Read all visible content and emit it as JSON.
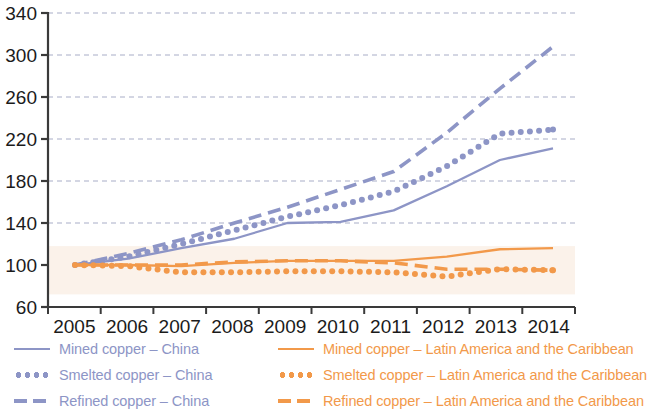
{
  "chart_data": {
    "type": "line",
    "title": "",
    "subtitle": "",
    "xlabel": "",
    "ylabel": "",
    "index_base": "2005 = 100",
    "x": [
      2005,
      2006,
      2007,
      2008,
      2009,
      2010,
      2011,
      2012,
      2013,
      2014
    ],
    "categories": [
      "2005",
      "2006",
      "2007",
      "2008",
      "2009",
      "2010",
      "2011",
      "2012",
      "2013",
      "2014"
    ],
    "ylim": [
      60,
      340
    ],
    "yticks": [
      60,
      100,
      140,
      180,
      220,
      260,
      300,
      340
    ],
    "ytick_labels": [
      "60",
      "100",
      "140",
      "180",
      "220",
      "260",
      "300",
      "340"
    ],
    "grid": true,
    "grid_style": "dashed-horizontal",
    "legend_position": "below",
    "series": [
      {
        "name": "Mined copper – China",
        "region": "China",
        "style": "solid",
        "color": "#8d95c6",
        "values": [
          100,
          106,
          116,
          125,
          140,
          141,
          152,
          175,
          200,
          211
        ]
      },
      {
        "name": "Smelted copper – China",
        "region": "China",
        "style": "dotted",
        "color": "#8d95c6",
        "values": [
          100,
          108,
          120,
          133,
          146,
          157,
          170,
          194,
          225,
          229
        ]
      },
      {
        "name": "Refined copper – China",
        "region": "China",
        "style": "dashed",
        "color": "#8d95c6",
        "values": [
          100,
          111,
          124,
          140,
          155,
          172,
          189,
          226,
          268,
          308
        ]
      },
      {
        "name": "Mined copper – Latin America and the Caribbean",
        "region": "Latin America and the Caribbean",
        "style": "solid",
        "color": "#f2994a",
        "values": [
          100,
          100,
          99,
          102,
          104,
          104,
          104,
          108,
          115,
          116
        ]
      },
      {
        "name": "Smelted copper – Latin America and the Caribbean",
        "region": "Latin America and the Caribbean",
        "style": "dotted",
        "color": "#f2994a",
        "values": [
          100,
          99,
          93,
          93,
          94,
          94,
          93,
          89,
          96,
          95
        ]
      },
      {
        "name": "Refined copper – Latin America and the Caribbean",
        "region": "Latin America and the Caribbean",
        "style": "dashed",
        "color": "#f2994a",
        "values": [
          100,
          100,
          100,
          103,
          104,
          104,
          102,
          96,
          96,
          95
        ]
      }
    ]
  },
  "legend": {
    "items": [
      {
        "label": "Mined copper – China",
        "style": "solid",
        "color": "#8d95c6"
      },
      {
        "label": "Smelted copper – China",
        "style": "dotted",
        "color": "#8d95c6"
      },
      {
        "label": "Refined copper – China",
        "style": "dashed",
        "color": "#8d95c6"
      },
      {
        "label": "Mined copper – Latin America and the Caribbean",
        "style": "solid",
        "color": "#f2994a"
      },
      {
        "label": "Smelted copper – Latin America and the Caribbean",
        "style": "dotted",
        "color": "#f2994a"
      },
      {
        "label": "Refined copper – Latin America and the Caribbean",
        "style": "dashed",
        "color": "#f2994a"
      }
    ]
  },
  "colors": {
    "china": "#8d95c6",
    "latin_america": "#f2994a",
    "axis": "#3a3a3a",
    "grid": "#9aa0bf",
    "text": "#1b1b1b",
    "band": "#fbf2ea"
  }
}
